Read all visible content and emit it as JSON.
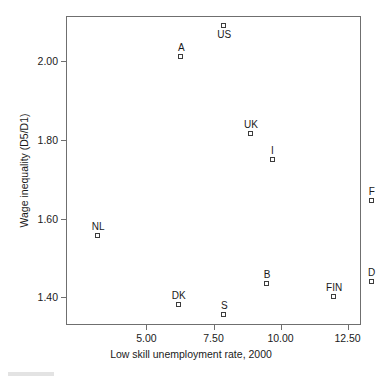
{
  "chart_data": {
    "type": "scatter",
    "title": "",
    "xlabel": "Low skill unemployment rate, 2000",
    "ylabel": "Wage inequality (D5/D1)",
    "xlim": [
      2.0,
      13.0
    ],
    "ylim": [
      1.33,
      2.115
    ],
    "xticks": [
      5.0,
      7.5,
      10.0,
      12.5
    ],
    "xticklabels": [
      "5.00",
      "7.50",
      "10.00",
      "12.50"
    ],
    "yticks": [
      2.0,
      1.8,
      1.6,
      1.4
    ],
    "yticklabels": [
      "2.00",
      "1.80",
      "1.60",
      "1.40"
    ],
    "grid": false,
    "legend": null,
    "marker": "open-square",
    "points": [
      {
        "label": "US",
        "x": 7.9,
        "y": 2.09,
        "label_pos": "below"
      },
      {
        "label": "A",
        "x": 6.3,
        "y": 2.01,
        "label_pos": "above"
      },
      {
        "label": "UK",
        "x": 8.9,
        "y": 1.815,
        "label_pos": "above"
      },
      {
        "label": "I",
        "x": 9.7,
        "y": 1.75,
        "label_pos": "above"
      },
      {
        "label": "F",
        "x": 13.4,
        "y": 1.645,
        "label_pos": "above"
      },
      {
        "label": "NL",
        "x": 3.2,
        "y": 1.555,
        "label_pos": "above"
      },
      {
        "label": "D",
        "x": 13.4,
        "y": 1.44,
        "label_pos": "above"
      },
      {
        "label": "B",
        "x": 9.5,
        "y": 1.435,
        "label_pos": "above"
      },
      {
        "label": "FIN",
        "x": 12.0,
        "y": 1.4,
        "label_pos": "above"
      },
      {
        "label": "DK",
        "x": 6.2,
        "y": 1.38,
        "label_pos": "above"
      },
      {
        "label": "S",
        "x": 7.9,
        "y": 1.355,
        "label_pos": "above"
      }
    ]
  },
  "colors": {
    "axis": "#6f6f6f",
    "marker_edge": "#3c3c3c",
    "text": "#1a1a1a",
    "background": "#ffffff"
  }
}
